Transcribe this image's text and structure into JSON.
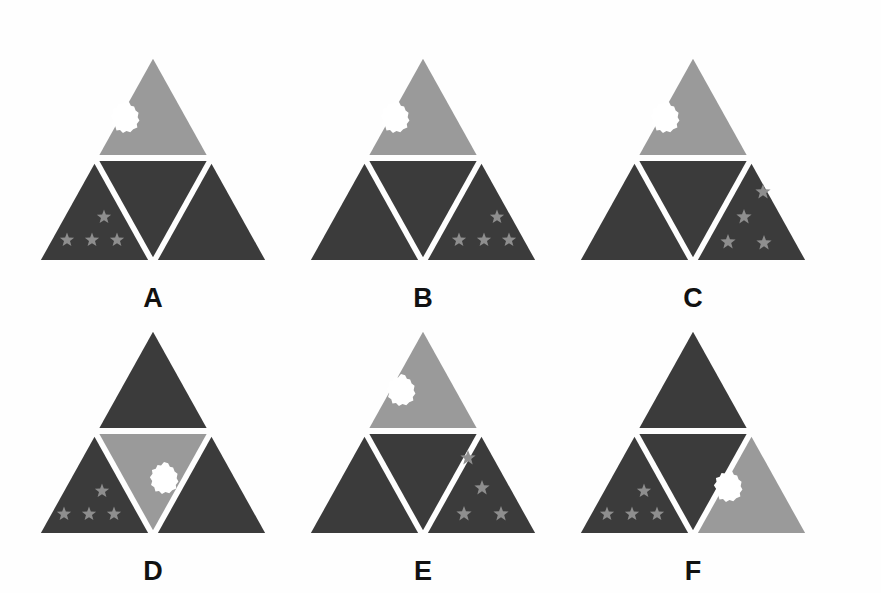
{
  "figure": {
    "title": "",
    "background_color": "#fefefe",
    "width": 881,
    "height": 593,
    "rows": 2,
    "columns": 3
  },
  "colors": {
    "dark": "#3b3b3b",
    "light": "#9a9a9a",
    "separator": "#ffffff",
    "cloud": "#ffffff",
    "star": "#8e8e8e",
    "star_on_dark": "#8a8a8a",
    "label": "#111111",
    "background": "#fefefe"
  },
  "legend": {
    "cloud_icon": "cloud-blob-icon",
    "star_icon": "five-point-star-icon",
    "triangle_icon": "triangle-icon"
  },
  "panels": [
    {
      "id": "A",
      "label": "A",
      "row": 1,
      "column": 1,
      "x": 28,
      "y": 40,
      "light_region": "top",
      "cloud_region": "top",
      "cloud_cx": 97,
      "cloud_cy": 72,
      "star_region": "bottom-left",
      "star_count": 4,
      "star_arrangement": "row-of-three-with-one-above",
      "stars": [
        {
          "cx": 39,
          "cy": 195,
          "r": 7.5
        },
        {
          "cx": 64,
          "cy": 195,
          "r": 7.5
        },
        {
          "cx": 89,
          "cy": 195,
          "r": 7.5
        },
        {
          "cx": 76,
          "cy": 172,
          "r": 7.5
        }
      ]
    },
    {
      "id": "B",
      "label": "B",
      "row": 1,
      "column": 2,
      "x": 298,
      "y": 40,
      "light_region": "top",
      "cloud_region": "top",
      "cloud_cx": 97,
      "cloud_cy": 72,
      "star_region": "bottom-right",
      "star_count": 4,
      "star_arrangement": "row-of-three-with-one-above",
      "stars": [
        {
          "cx": 161,
          "cy": 195,
          "r": 7.5
        },
        {
          "cx": 186,
          "cy": 195,
          "r": 7.5
        },
        {
          "cx": 211,
          "cy": 195,
          "r": 7.5
        },
        {
          "cx": 199,
          "cy": 172,
          "r": 7.5
        }
      ]
    },
    {
      "id": "C",
      "label": "C",
      "row": 1,
      "column": 3,
      "x": 568,
      "y": 40,
      "light_region": "top",
      "cloud_region": "top",
      "cloud_cx": 97,
      "cloud_cy": 72,
      "star_region": "bottom-right",
      "star_count": 4,
      "star_arrangement": "southern-cross-diamond",
      "stars": [
        {
          "cx": 195,
          "cy": 147,
          "r": 8
        },
        {
          "cx": 176,
          "cy": 172,
          "r": 8
        },
        {
          "cx": 160,
          "cy": 197,
          "r": 8
        },
        {
          "cx": 196,
          "cy": 198,
          "r": 8
        }
      ]
    },
    {
      "id": "D",
      "label": "D",
      "row": 2,
      "column": 1,
      "x": 28,
      "y": 310,
      "light_region": "center",
      "cloud_region": "center",
      "cloud_cx": 136,
      "cloud_cy": 160,
      "star_region": "bottom-left",
      "star_count": 4,
      "star_arrangement": "row-of-three-with-one-above",
      "stars": [
        {
          "cx": 36,
          "cy": 196,
          "r": 7.5
        },
        {
          "cx": 61,
          "cy": 196,
          "r": 7.5
        },
        {
          "cx": 86,
          "cy": 196,
          "r": 7.5
        },
        {
          "cx": 74,
          "cy": 173,
          "r": 7.5
        }
      ]
    },
    {
      "id": "E",
      "label": "E",
      "row": 2,
      "column": 2,
      "x": 298,
      "y": 310,
      "light_region": "top",
      "cloud_region": "top",
      "cloud_cx": 103,
      "cloud_cy": 72,
      "star_region": "bottom-right",
      "star_count": 4,
      "star_arrangement": "southern-cross-diamond",
      "stars": [
        {
          "cx": 170,
          "cy": 140,
          "r": 8
        },
        {
          "cx": 184,
          "cy": 170,
          "r": 8
        },
        {
          "cx": 166,
          "cy": 196,
          "r": 8
        },
        {
          "cx": 203,
          "cy": 196,
          "r": 8
        }
      ]
    },
    {
      "id": "F",
      "label": "F",
      "row": 2,
      "column": 3,
      "x": 568,
      "y": 310,
      "light_region": "bottom-right",
      "cloud_region": "bottom-right",
      "cloud_cx": 160,
      "cloud_cy": 168,
      "star_region": "bottom-left",
      "star_count": 4,
      "star_arrangement": "row-of-three-with-one-above",
      "stars": [
        {
          "cx": 39,
          "cy": 196,
          "r": 7.5
        },
        {
          "cx": 64,
          "cy": 196,
          "r": 7.5
        },
        {
          "cx": 89,
          "cy": 196,
          "r": 7.5
        },
        {
          "cx": 76,
          "cy": 173,
          "r": 7.5
        }
      ]
    }
  ],
  "geometry": {
    "apex_x": 125,
    "apex_y": 8,
    "base_left_x": 8,
    "base_right_x": 242,
    "base_y": 218,
    "mid_left_x": 66.5,
    "mid_left_y": 113,
    "mid_right_x": 183.5,
    "mid_right_y": 113,
    "mid_base_x": 125,
    "mid_base_y": 218,
    "gap": 3
  }
}
